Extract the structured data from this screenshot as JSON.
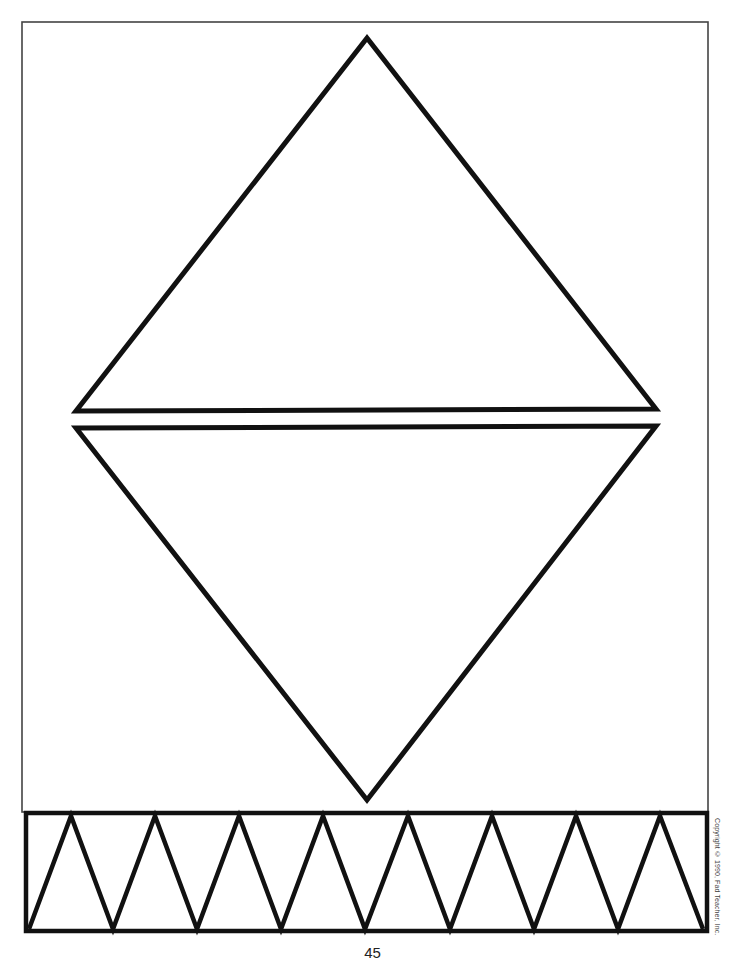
{
  "worksheet": {
    "shapes": {
      "upper_triangle": {
        "description": "large outlined triangle pointing up",
        "stroke": "#111111"
      },
      "lower_triangle": {
        "description": "large outlined triangle pointing down",
        "stroke": "#111111"
      },
      "zigzag_band": {
        "description": "rectangular border band containing zigzag triangles",
        "peaks": 8,
        "stroke": "#111111"
      }
    },
    "frame_color": "#444444",
    "copyright": "Copyright © 1990, Fad Teacher, Inc.",
    "page_number": "45"
  }
}
